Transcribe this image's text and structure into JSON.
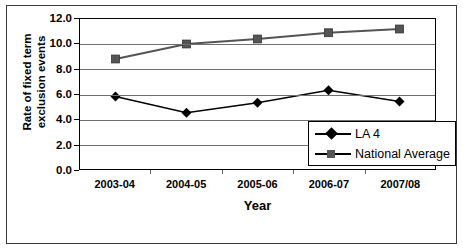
{
  "chart_data": {
    "type": "line",
    "title": "",
    "xlabel": "Year",
    "ylabel": "Rate of fixed term exclusion events",
    "ylabel_line1": "Rate of fixed term",
    "ylabel_line2": "exclusion events",
    "categories": [
      "2003-04",
      "2004-05",
      "2005-06",
      "2006-07",
      "2007/08"
    ],
    "series": [
      {
        "name": "LA 4",
        "marker": "diamond",
        "color": "#000000",
        "values": [
          5.8,
          4.5,
          5.3,
          6.3,
          5.4
        ]
      },
      {
        "name": "National Average",
        "marker": "square",
        "color": "#555555",
        "values": [
          8.8,
          10.0,
          10.4,
          10.9,
          11.2
        ]
      }
    ],
    "ylim": [
      0.0,
      12.0
    ],
    "ytick_labels": [
      "0.0",
      "2.0",
      "4.0",
      "6.0",
      "8.0",
      "10.0",
      "12.0"
    ],
    "ytick_values": [
      0.0,
      2.0,
      4.0,
      6.0,
      8.0,
      10.0,
      12.0
    ],
    "grid": true,
    "legend_position": "bottom-right"
  },
  "legend": {
    "entries": [
      {
        "label": "LA 4",
        "marker": "diamond-marker-icon"
      },
      {
        "label": "National Average",
        "marker": "square-marker-icon"
      }
    ]
  },
  "axes": {
    "x_title": "Year",
    "y_title_line1": "Rate of fixed term",
    "y_title_line2": "exclusion events"
  }
}
